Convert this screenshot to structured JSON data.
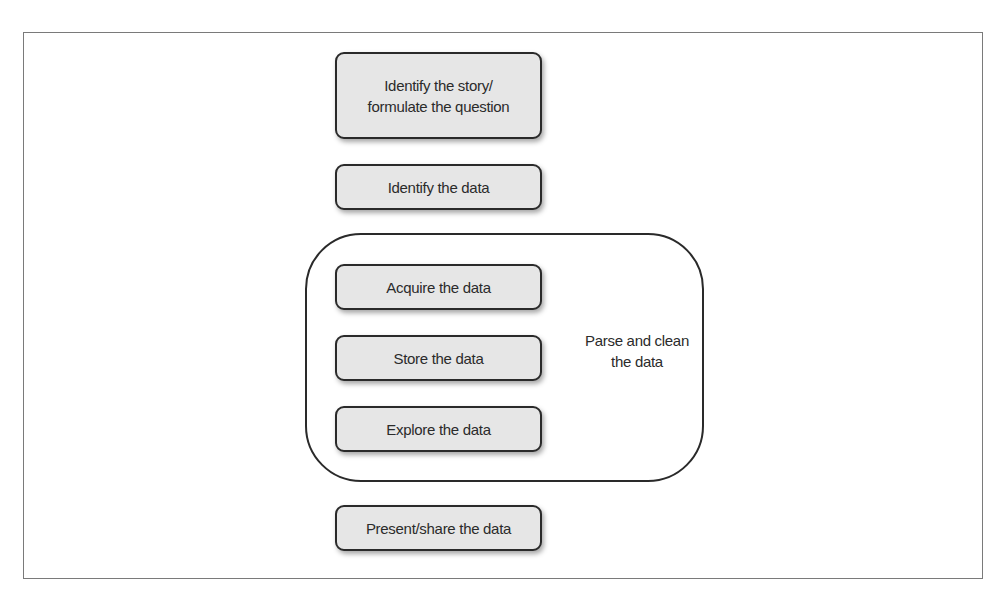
{
  "diagram": {
    "type": "process-flow",
    "steps": [
      {
        "id": "identify-story",
        "label": "Identify the story/\nformulate the question",
        "line1": "Identify the story/",
        "line2": "formulate the question"
      },
      {
        "id": "identify-data",
        "label": "Identify the data"
      },
      {
        "id": "acquire-data",
        "label": "Acquire the data"
      },
      {
        "id": "store-data",
        "label": "Store the data"
      },
      {
        "id": "explore-data",
        "label": "Explore the data"
      },
      {
        "id": "present-data",
        "label": "Present/share the data"
      }
    ],
    "group": {
      "label_line1": "Parse and clean",
      "label_line2": "the data",
      "contains": [
        "acquire-data",
        "store-data",
        "explore-data"
      ]
    },
    "colors": {
      "box_fill": "#e6e6e6",
      "box_border": "#2a2a2a",
      "frame_border": "#7a7a7a",
      "text": "#2b2b2b"
    }
  }
}
